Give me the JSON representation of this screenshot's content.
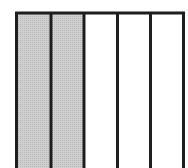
{
  "diagram": {
    "type": "fraction-bar",
    "total_parts": 5,
    "shaded_parts": 2,
    "fraction": "2/5",
    "colors": {
      "shaded": "#c8c8c8",
      "unshaded": "#ffffff",
      "border": "#1e1e1e"
    }
  }
}
